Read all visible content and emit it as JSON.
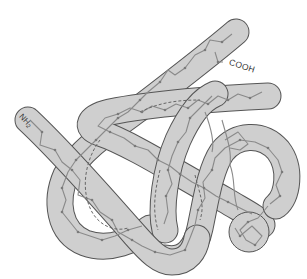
{
  "figure": {
    "title": "",
    "labels": {
      "n_terminus": "NH",
      "n_terminus_subscript": "2",
      "c_terminus": "COOH"
    },
    "colors": {
      "background": "#ffffff",
      "tube_fill": "#cfcfcf",
      "tube_outline": "#555555",
      "chain": "#8a8a8a",
      "chain_dots": "#7a7a7a",
      "label_text": "#333333"
    }
  }
}
